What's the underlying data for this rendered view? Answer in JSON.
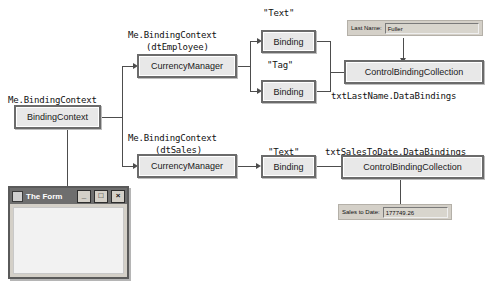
{
  "diagram": {
    "nodes": {
      "binding_context": "BindingContext",
      "currency_manager_employee": "CurrencyManager",
      "currency_manager_sales": "CurrencyManager",
      "binding_text_employee": "Binding",
      "binding_tag_employee": "Binding",
      "binding_text_sales": "Binding",
      "control_binding_collection_lastname": "ControlBindingCollection",
      "control_binding_collection_salestodate": "ControlBindingCollection"
    },
    "labels": {
      "me_bindingcontext": "Me.BindingContext",
      "me_bindingcontext_dtemployee_line1": "Me.BindingContext",
      "me_bindingcontext_dtemployee_line2": "(dtEmployee)",
      "me_bindingcontext_dtsales_line1": "Me.BindingContext",
      "me_bindingcontext_dtsales_line2": "(dtSales)",
      "text_property_employee": "\"Text\"",
      "tag_property_employee": "\"Tag\"",
      "text_property_sales": "\"Text\"",
      "txt_lastname_databindings": "txtLastName.DataBindings",
      "txt_salestodate_databindings": "txtSalesToDate.DataBindings"
    }
  },
  "last_name_control": {
    "label": "Last Name:",
    "value": "Fuller"
  },
  "sales_to_date_control": {
    "label": "Sales to Date:",
    "value": "177749.26"
  },
  "form_window": {
    "title": "The Form",
    "minimize_label": "_",
    "maximize_label": "□",
    "close_label": "×"
  },
  "colors": {
    "node_fill": "#e8e8e8",
    "node_border": "#6b6b6b",
    "connector": "#4d4d4d",
    "titlebar": "#6e6e6e",
    "control_face": "#d4d0c8",
    "form_client": "#f2f2f2"
  }
}
